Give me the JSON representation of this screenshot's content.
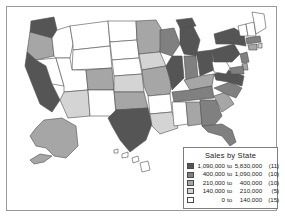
{
  "title": "Sales by State",
  "legend": {
    "title": "Sales by State",
    "rows": [
      {
        "swatch": "#555555",
        "low": "1,090,000",
        "to": "to",
        "high": "5,830,000",
        "count": "(11)"
      },
      {
        "swatch": "#808080",
        "low": "400,000",
        "to": "to",
        "high": "1,090,000",
        "count": "(10)"
      },
      {
        "swatch": "#a6a6a6",
        "low": "210,000",
        "to": "to",
        "high": "400,000",
        "count": "(10)"
      },
      {
        "swatch": "#d4d4d4",
        "low": "140,000",
        "to": "to",
        "high": "210,000",
        "count": "(5)"
      },
      {
        "swatch": "#ffffff",
        "low": "0",
        "to": "to",
        "high": "140,000",
        "count": "(15)"
      }
    ]
  },
  "chart_data": {
    "type": "map",
    "title": "Sales by State",
    "subtype": "choropleth",
    "region": "United States",
    "measure": "Sales",
    "class_count": 5,
    "classes": [
      {
        "index": 0,
        "min": 1090000,
        "max": 5830000,
        "label": "1,090,000 to 5,830,000",
        "state_count": 11,
        "color": "#555555"
      },
      {
        "index": 1,
        "min": 400000,
        "max": 1090000,
        "label": "400,000 to 1,090,000",
        "state_count": 10,
        "color": "#808080"
      },
      {
        "index": 2,
        "min": 210000,
        "max": 400000,
        "label": "210,000 to 400,000",
        "state_count": 10,
        "color": "#a6a6a6"
      },
      {
        "index": 3,
        "min": 140000,
        "max": 210000,
        "label": "140,000 to 210,000",
        "state_count": 5,
        "color": "#d4d4d4"
      },
      {
        "index": 4,
        "min": 0,
        "max": 140000,
        "label": "0 to 140,000",
        "state_count": 15,
        "color": "#ffffff"
      }
    ],
    "total_states": 51,
    "legend_position": "bottom-right",
    "insets": [
      "Alaska",
      "Hawaii"
    ],
    "states": [
      {
        "code": "WA",
        "name": "Washington",
        "class": 0
      },
      {
        "code": "OR",
        "name": "Oregon",
        "class": 2
      },
      {
        "code": "CA",
        "name": "California",
        "class": 0
      },
      {
        "code": "ID",
        "name": "Idaho",
        "class": 4
      },
      {
        "code": "NV",
        "name": "Nevada",
        "class": 4
      },
      {
        "code": "MT",
        "name": "Montana",
        "class": 4
      },
      {
        "code": "WY",
        "name": "Wyoming",
        "class": 4
      },
      {
        "code": "UT",
        "name": "Utah",
        "class": 4
      },
      {
        "code": "CO",
        "name": "Colorado",
        "class": 2
      },
      {
        "code": "AZ",
        "name": "Arizona",
        "class": 3
      },
      {
        "code": "NM",
        "name": "New Mexico",
        "class": 4
      },
      {
        "code": "ND",
        "name": "North Dakota",
        "class": 4
      },
      {
        "code": "SD",
        "name": "South Dakota",
        "class": 4
      },
      {
        "code": "NE",
        "name": "Nebraska",
        "class": 4
      },
      {
        "code": "KS",
        "name": "Kansas",
        "class": 3
      },
      {
        "code": "OK",
        "name": "Oklahoma",
        "class": 2
      },
      {
        "code": "TX",
        "name": "Texas",
        "class": 0
      },
      {
        "code": "MN",
        "name": "Minnesota",
        "class": 2
      },
      {
        "code": "IA",
        "name": "Iowa",
        "class": 3
      },
      {
        "code": "MO",
        "name": "Missouri",
        "class": 2
      },
      {
        "code": "AR",
        "name": "Arkansas",
        "class": 4
      },
      {
        "code": "LA",
        "name": "Louisiana",
        "class": 3
      },
      {
        "code": "WI",
        "name": "Wisconsin",
        "class": 1
      },
      {
        "code": "IL",
        "name": "Illinois",
        "class": 0
      },
      {
        "code": "MI",
        "name": "Michigan",
        "class": 0
      },
      {
        "code": "IN",
        "name": "Indiana",
        "class": 1
      },
      {
        "code": "OH",
        "name": "Ohio",
        "class": 0
      },
      {
        "code": "KY",
        "name": "Kentucky",
        "class": 2
      },
      {
        "code": "TN",
        "name": "Tennessee",
        "class": 1
      },
      {
        "code": "MS",
        "name": "Mississippi",
        "class": 4
      },
      {
        "code": "AL",
        "name": "Alabama",
        "class": 2
      },
      {
        "code": "GA",
        "name": "Georgia",
        "class": 1
      },
      {
        "code": "FL",
        "name": "Florida",
        "class": 1
      },
      {
        "code": "SC",
        "name": "South Carolina",
        "class": 2
      },
      {
        "code": "NC",
        "name": "North Carolina",
        "class": 1
      },
      {
        "code": "VA",
        "name": "Virginia",
        "class": 0
      },
      {
        "code": "WV",
        "name": "West Virginia",
        "class": 4
      },
      {
        "code": "PA",
        "name": "Pennsylvania",
        "class": 0
      },
      {
        "code": "NY",
        "name": "New York",
        "class": 0
      },
      {
        "code": "VT",
        "name": "Vermont",
        "class": 4
      },
      {
        "code": "NH",
        "name": "New Hampshire",
        "class": 4
      },
      {
        "code": "ME",
        "name": "Maine",
        "class": 4
      },
      {
        "code": "MA",
        "name": "Massachusetts",
        "class": 1
      },
      {
        "code": "RI",
        "name": "Rhode Island",
        "class": 3
      },
      {
        "code": "CT",
        "name": "Connecticut",
        "class": 2
      },
      {
        "code": "NJ",
        "name": "New Jersey",
        "class": 1
      },
      {
        "code": "DE",
        "name": "Delaware",
        "class": 2
      },
      {
        "code": "MD",
        "name": "Maryland",
        "class": 1
      },
      {
        "code": "AK",
        "name": "Alaska",
        "class": 2
      },
      {
        "code": "HI",
        "name": "Hawaii",
        "class": 4
      }
    ]
  }
}
